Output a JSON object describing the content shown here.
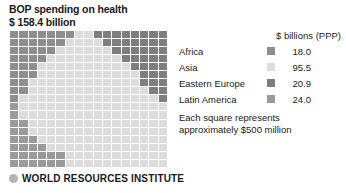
{
  "title": {
    "line1": "BOP spending on health",
    "line2": "$ 158.4 billion"
  },
  "legend": {
    "header": "$ billions (PPP)",
    "rows": [
      {
        "label": "Africa",
        "value": "18.0",
        "color": "#8e8e8e",
        "swatch_name": "africa-swatch"
      },
      {
        "label": "Asia",
        "value": "95.5",
        "color": "#dcdcdc",
        "swatch_name": "asia-swatch"
      },
      {
        "label": "Eastern Europe",
        "value": "20.9",
        "color": "#7d7d7d",
        "swatch_name": "eastern-europe-swatch"
      },
      {
        "label": "Latin America",
        "value": "24.0",
        "color": "#9a9a9a",
        "swatch_name": "latin-america-swatch"
      }
    ]
  },
  "note": {
    "line1": "Each square represents",
    "line2": "approximately $500 million"
  },
  "footer": {
    "organization": "WORLD RESOURCES INSTITUTE",
    "bullet_color": "#b4b4b4"
  },
  "chart_data": {
    "type": "waffle",
    "title": "BOP spending on health",
    "total_label": "$ 158.4 billion",
    "total_value": 158.4,
    "unit": "$ billions (PPP)",
    "square_value": 0.5,
    "square_value_label": "approximately $500 million",
    "grid": {
      "columns": 17,
      "rows": 17
    },
    "categories": [
      "Africa",
      "Asia",
      "Eastern Europe",
      "Latin America"
    ],
    "values": [
      18.0,
      95.5,
      20.9,
      24.0
    ],
    "colors": [
      "#8e8e8e",
      "#dcdcdc",
      "#7d7d7d",
      "#9a9a9a"
    ],
    "squares": [
      36,
      191,
      42,
      48
    ],
    "legend_position": "right",
    "grid_lines": "white",
    "cells": [
      [
        "africa",
        "africa",
        "africa",
        "africa",
        "africa",
        "africa",
        "africa",
        "asia",
        "asia",
        "eeurope",
        "eeurope",
        "eeurope",
        "eeurope",
        "eeurope",
        "eeurope",
        "eeurope",
        "eeurope"
      ],
      [
        "africa",
        "africa",
        "africa",
        "africa",
        "africa",
        "africa",
        "asia",
        "asia",
        "asia",
        "asia",
        "eeurope",
        "eeurope",
        "eeurope",
        "eeurope",
        "eeurope",
        "eeurope",
        "eeurope"
      ],
      [
        "africa",
        "africa",
        "africa",
        "africa",
        "africa",
        "asia",
        "asia",
        "asia",
        "asia",
        "asia",
        "asia",
        "eeurope",
        "eeurope",
        "eeurope",
        "eeurope",
        "eeurope",
        "eeurope"
      ],
      [
        "africa",
        "africa",
        "africa",
        "africa",
        "asia",
        "asia",
        "asia",
        "asia",
        "asia",
        "asia",
        "asia",
        "asia",
        "eeurope",
        "eeurope",
        "eeurope",
        "eeurope",
        "eeurope"
      ],
      [
        "africa",
        "africa",
        "africa",
        "asia",
        "asia",
        "asia",
        "asia",
        "asia",
        "asia",
        "asia",
        "asia",
        "asia",
        "asia",
        "eeurope",
        "eeurope",
        "eeurope",
        "eeurope"
      ],
      [
        "africa",
        "africa",
        "africa",
        "asia",
        "asia",
        "asia",
        "asia",
        "asia",
        "asia",
        "asia",
        "asia",
        "asia",
        "asia",
        "asia",
        "eeurope",
        "eeurope",
        "eeurope"
      ],
      [
        "africa",
        "africa",
        "asia",
        "asia",
        "asia",
        "asia",
        "asia",
        "asia",
        "asia",
        "asia",
        "asia",
        "asia",
        "asia",
        "asia",
        "eeurope",
        "eeurope",
        "eeurope"
      ],
      [
        "africa",
        "africa",
        "asia",
        "asia",
        "asia",
        "asia",
        "asia",
        "asia",
        "asia",
        "asia",
        "asia",
        "asia",
        "asia",
        "asia",
        "asia",
        "eeurope",
        "eeurope"
      ],
      [
        "africa",
        "asia",
        "asia",
        "asia",
        "asia",
        "asia",
        "asia",
        "asia",
        "asia",
        "asia",
        "asia",
        "asia",
        "asia",
        "asia",
        "asia",
        "asia",
        "eeurope"
      ],
      [
        "latin",
        "asia",
        "asia",
        "asia",
        "asia",
        "asia",
        "asia",
        "asia",
        "asia",
        "asia",
        "asia",
        "asia",
        "asia",
        "asia",
        "asia",
        "asia",
        "asia"
      ],
      [
        "latin",
        "asia",
        "asia",
        "asia",
        "asia",
        "asia",
        "asia",
        "asia",
        "asia",
        "asia",
        "asia",
        "asia",
        "asia",
        "asia",
        "asia",
        "asia",
        "asia"
      ],
      [
        "latin",
        "latin",
        "asia",
        "asia",
        "asia",
        "asia",
        "asia",
        "asia",
        "asia",
        "asia",
        "asia",
        "asia",
        "asia",
        "asia",
        "asia",
        "asia",
        "asia"
      ],
      [
        "latin",
        "latin",
        "asia",
        "asia",
        "asia",
        "asia",
        "asia",
        "asia",
        "asia",
        "asia",
        "asia",
        "asia",
        "asia",
        "asia",
        "asia",
        "asia",
        "asia"
      ],
      [
        "latin",
        "latin",
        "latin",
        "asia",
        "asia",
        "asia",
        "asia",
        "asia",
        "asia",
        "asia",
        "asia",
        "asia",
        "asia",
        "asia",
        "asia",
        "asia",
        "asia"
      ],
      [
        "latin",
        "latin",
        "latin",
        "latin",
        "asia",
        "asia",
        "asia",
        "asia",
        "asia",
        "asia",
        "asia",
        "asia",
        "asia",
        "asia",
        "asia",
        "asia",
        "asia"
      ],
      [
        "latin",
        "latin",
        "latin",
        "latin",
        "latin",
        "latin",
        "asia",
        "asia",
        "asia",
        "asia",
        "asia",
        "asia",
        "asia",
        "asia",
        "asia",
        "asia",
        "asia"
      ],
      [
        "latin",
        "latin",
        "latin",
        "latin",
        "latin",
        "latin",
        "asia",
        "asia",
        "asia",
        "asia",
        "asia",
        "asia",
        "asia",
        "asia",
        "asia",
        "asia",
        "asia"
      ]
    ]
  }
}
